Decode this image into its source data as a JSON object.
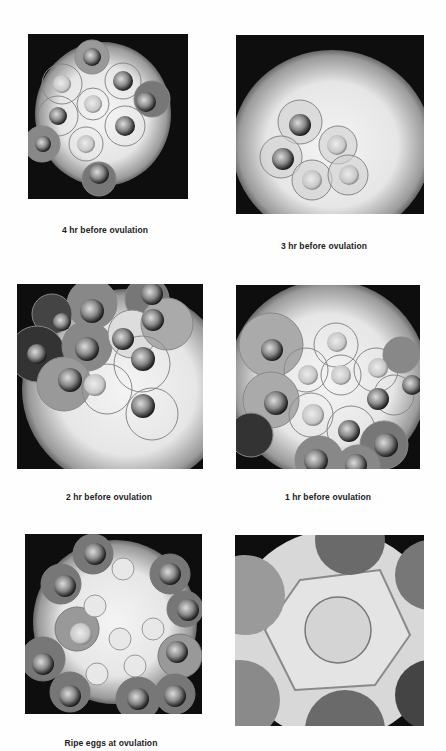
{
  "figure": {
    "panels": [
      {
        "id": "p1",
        "caption": "4 hr before ovulation"
      },
      {
        "id": "p2",
        "caption": "3 hr before ovulation"
      },
      {
        "id": "p3",
        "caption": "2 hr before ovulation"
      },
      {
        "id": "p4",
        "caption": "1 hr before ovulation"
      },
      {
        "id": "p5",
        "caption": "Ripe eggs at ovulation"
      },
      {
        "id": "p6",
        "caption": ""
      }
    ]
  }
}
